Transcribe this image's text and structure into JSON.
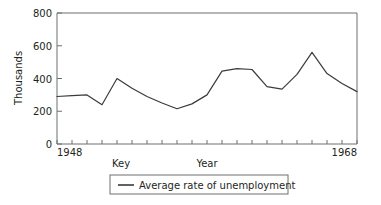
{
  "chart_data": {
    "type": "line",
    "title": "",
    "xlabel": "Year",
    "ylabel": "Thousands",
    "xlim": [
      1948,
      1968
    ],
    "ylim": [
      0,
      800
    ],
    "grid": false,
    "legend_position": "bottom",
    "x_tick_labels": [
      "1948",
      "1968"
    ],
    "y_tick_labels": [
      "0",
      "200",
      "400",
      "600",
      "800"
    ],
    "y_ticks": [
      0,
      200,
      400,
      600,
      800
    ],
    "key_label": "Key",
    "x": [
      1948,
      1949,
      1950,
      1951,
      1952,
      1953,
      1954,
      1955,
      1956,
      1957,
      1958,
      1959,
      1960,
      1961,
      1962,
      1963,
      1964,
      1965,
      1966,
      1967,
      1968
    ],
    "series": [
      {
        "name": "Average rate of unemployment",
        "values": [
          290,
          295,
          300,
          240,
          400,
          340,
          290,
          250,
          215,
          245,
          300,
          445,
          460,
          455,
          350,
          335,
          425,
          560,
          430,
          370,
          320
        ]
      }
    ],
    "annotations": []
  },
  "axis": {
    "y_title": "Thousands",
    "x_title": "Year",
    "x_start_label": "1948",
    "x_end_label": "1968",
    "y_labels": [
      "800",
      "600",
      "400",
      "200",
      "0"
    ]
  },
  "legend": {
    "key_caption": "Key",
    "entries": [
      {
        "label": "Average rate of unemployment",
        "color": "#3b3b3b"
      }
    ]
  },
  "colors": {
    "series": "#3b3b3b",
    "frame": "#6d6e71",
    "text": "#231f20",
    "background": "#ffffff"
  }
}
